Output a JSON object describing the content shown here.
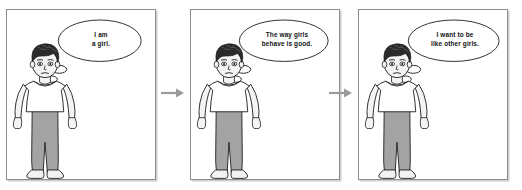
{
  "figure": {
    "type": "comic-strip",
    "panel_count": 3,
    "background_color": "#ffffff",
    "panel_border_color": "#8d8d8d",
    "arrow_color": "#9a9a9a",
    "hair_color": "#2b2b2b",
    "shirt_color": "#ffffff",
    "pants_color": "#a3a3a3",
    "shoe_color": "#f2f2f2",
    "skin_color": "#f4f4f4",
    "outline_color": "#1a1a1a"
  },
  "panels": [
    {
      "id": "panel-1",
      "character": "boy-figure",
      "thought_text": "I am\na girl.",
      "thought_line_1": "I am",
      "thought_line_2": "a girl.",
      "arrow_after": true
    },
    {
      "id": "panel-2",
      "character": "boy-figure",
      "thought_text": "The way girls\nbehave is good.",
      "thought_line_1": "The way girls",
      "thought_line_2": "behave is good.",
      "arrow_after": true
    },
    {
      "id": "panel-3",
      "character": "boy-figure",
      "thought_text": "I want to be\nlike other girls.",
      "thought_line_1": "I want to be",
      "thought_line_2": "like other girls.",
      "arrow_after": false
    }
  ],
  "arrows": [
    {
      "id": "arrow-1",
      "glyph": "right-arrow",
      "between": "panel-1 to panel-2"
    },
    {
      "id": "arrow-2",
      "glyph": "right-arrow",
      "between": "panel-2 to panel-3"
    }
  ]
}
